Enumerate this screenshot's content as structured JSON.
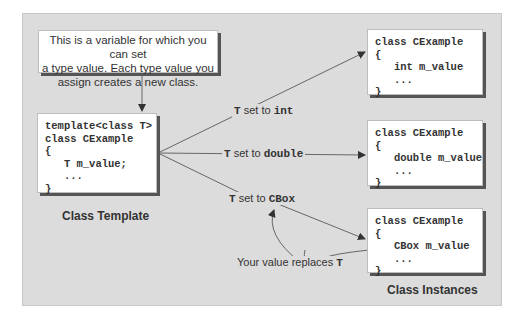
{
  "callout": {
    "text_lines": [
      "This is a variable for which you can set",
      "a type value. Each type value you",
      "assign creates a new class."
    ]
  },
  "template_box": {
    "lines": [
      "template<class T>",
      "class CExample",
      "{",
      "   T m_value;",
      "   ...",
      "}"
    ],
    "caption": "Class Template"
  },
  "instances": [
    {
      "lines": [
        "class CExample",
        "{",
        "   int m_value",
        "   ...",
        "}"
      ]
    },
    {
      "lines": [
        "class CExample",
        "{",
        "   double m_value",
        "   ...",
        "}"
      ]
    },
    {
      "lines": [
        "class CExample",
        "{",
        "   CBox m_value",
        "   ...",
        "}"
      ]
    }
  ],
  "instances_caption": "Class Instances",
  "arrow_labels": [
    {
      "prefix": "T",
      "middle": " set to ",
      "type": "int"
    },
    {
      "prefix": "T",
      "middle": " set to ",
      "type": "double"
    },
    {
      "prefix": "T",
      "middle": " set to ",
      "type": "CBox"
    }
  ],
  "replace_note": {
    "text": "Your value replaces ",
    "symbol": "T"
  },
  "colors": {
    "panel": "#dcdcdc",
    "box": "#ffffff",
    "shadow": "#555555",
    "line": "#666666"
  }
}
